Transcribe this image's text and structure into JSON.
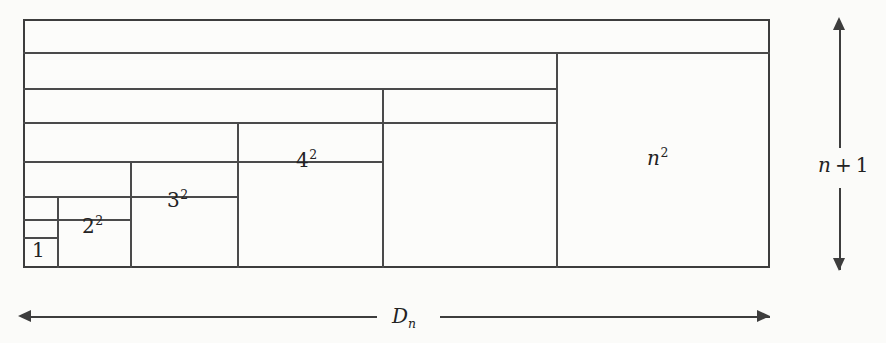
{
  "figure": {
    "background_color": "#fbfbf9",
    "line_color": "#3d3d3d",
    "text_color": "#232323",
    "outer_rectangle": {
      "left": 23,
      "top": 19,
      "width": 747,
      "height": 249
    },
    "block_labels": [
      {
        "name": "one",
        "text": "1",
        "base": "1",
        "exponent": "",
        "left": 32,
        "top": 240
      },
      {
        "name": "two-sq",
        "text": "2²",
        "base": "2",
        "exponent": "2",
        "left": 82,
        "top": 216
      },
      {
        "name": "three-sq",
        "text": "3²",
        "base": "3",
        "exponent": "2",
        "left": 167,
        "top": 190
      },
      {
        "name": "four-sq",
        "text": "4²",
        "base": "4",
        "exponent": "2",
        "left": 296,
        "top": 150
      },
      {
        "name": "n-sq",
        "text": "n²",
        "base": "n",
        "exponent": "2",
        "left": 647,
        "top": 148
      }
    ],
    "blocks": [
      {
        "name": "one",
        "x": 23,
        "y": 237,
        "w": 34,
        "h": 31
      },
      {
        "name": "two-sq",
        "x": 57,
        "y": 196,
        "w": 73,
        "h": 72
      },
      {
        "name": "three-sq",
        "x": 130,
        "y": 161,
        "w": 107,
        "h": 107
      },
      {
        "name": "four-sq",
        "x": 237,
        "y": 122,
        "w": 145,
        "h": 146
      },
      {
        "name": "n-sq",
        "x": 556,
        "y": 54,
        "w": 214,
        "h": 214
      }
    ],
    "horizontal_dividers": [
      52,
      88,
      122,
      161,
      196,
      219,
      237
    ],
    "vertical_dividers": [
      57,
      130,
      237,
      382,
      556
    ],
    "vertical_dimension": {
      "label_base": "n",
      "label_operator": "+",
      "label_term": "1",
      "label_text": "n + 1",
      "arrow": "double-ended-vertical"
    },
    "horizontal_dimension": {
      "label_base": "D",
      "label_subscript": "n",
      "label_text": "Dₙ",
      "arrow": "double-ended-horizontal"
    }
  }
}
